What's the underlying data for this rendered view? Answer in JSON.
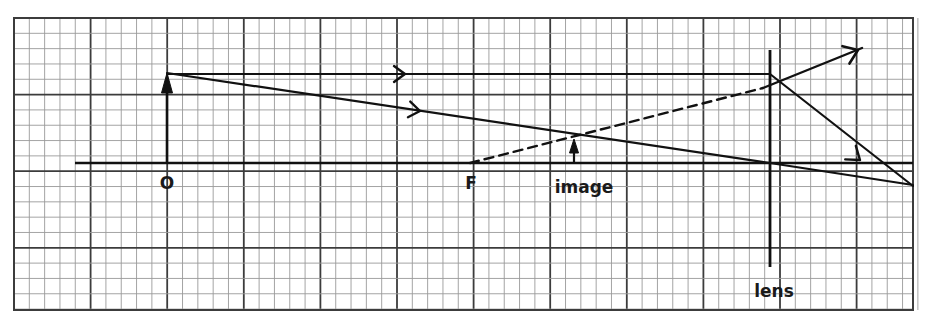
{
  "figure": {
    "background": "#ffffff",
    "width": 928,
    "height": 323
  },
  "grid": {
    "x0": 14,
    "y0": 18,
    "x1": 913,
    "y1": 310,
    "minor_step": 15.32,
    "major_every": 5,
    "minor_color": "#9a9a9a",
    "major_color": "#3c3c3c",
    "border_color": "#3c3c3c",
    "minor_width": 0.9,
    "major_width": 1.8,
    "show_grid": true
  },
  "labels": [
    {
      "name": "object-label",
      "text": "O",
      "x": 167,
      "y": 189,
      "size": 17,
      "anchor": "middle"
    },
    {
      "name": "focus-label",
      "text": "F",
      "x": 471,
      "y": 189,
      "size": 17,
      "anchor": "middle"
    },
    {
      "name": "image-label",
      "text": "image",
      "x": 584,
      "y": 193,
      "size": 17,
      "anchor": "middle"
    },
    {
      "name": "lens-label",
      "text": "lens",
      "x": 774,
      "y": 297,
      "size": 17,
      "anchor": "middle"
    }
  ],
  "optics": {
    "stroke": "#111111",
    "axis": {
      "name": "principal-axis",
      "x1": 75,
      "y1": 163,
      "x2": 913,
      "y2": 163,
      "width": 2.6
    },
    "lens": {
      "name": "lens-plane",
      "x": 770,
      "y_top": 50,
      "y_bottom": 267,
      "width": 2.8
    },
    "object_arrow": {
      "name": "object-arrow",
      "x": 167,
      "y_base": 163,
      "y_tip": 73,
      "width": 2.6,
      "head_width": 11,
      "head_length": 20
    },
    "image_arrow": {
      "name": "image-arrow",
      "x": 574,
      "y_base": 163,
      "y_tip": 139,
      "width": 2.2,
      "head_width": 9,
      "head_length": 14
    },
    "rays": [
      {
        "name": "ray-parallel-incident",
        "style": "solid",
        "points": [
          [
            167,
            74
          ],
          [
            770,
            74
          ]
        ],
        "width": 2.2,
        "markers": [
          {
            "x": 405,
            "y": 74,
            "angle": 0,
            "size": 11
          }
        ]
      },
      {
        "name": "ray-parallel-refracted",
        "style": "solid",
        "points": [
          [
            770,
            74
          ],
          [
            913,
            186
          ]
        ],
        "width": 2.2,
        "markers": [
          {
            "x": 860,
            "y": 160,
            "angle": 38,
            "size": 12
          }
        ]
      },
      {
        "name": "ray-through-center-incident",
        "style": "solid",
        "points": [
          [
            167,
            73
          ],
          [
            770,
            163
          ]
        ],
        "width": 2.2,
        "markers": [
          {
            "x": 420,
            "y": 111,
            "angle": 8.5,
            "size": 11
          }
        ]
      },
      {
        "name": "ray-through-center-refracted",
        "style": "solid",
        "points": [
          [
            770,
            163
          ],
          [
            913,
            185
          ]
        ],
        "width": 2.2,
        "markers": []
      },
      {
        "name": "ray-through-focus-virtual",
        "style": "dashed",
        "points": [
          [
            470,
            163
          ],
          [
            763,
            88
          ]
        ],
        "width": 2.4,
        "dash": "9,6",
        "markers": []
      },
      {
        "name": "ray-through-focus-refracted",
        "style": "solid",
        "points": [
          [
            763,
            88
          ],
          [
            862,
            48
          ]
        ],
        "width": 2.4,
        "markers": [
          {
            "x": 858,
            "y": 50,
            "angle": -22,
            "size": 13
          }
        ]
      }
    ]
  }
}
